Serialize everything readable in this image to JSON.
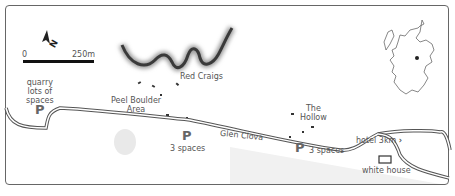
{
  "scale_bar": {
    "start": "0",
    "end": "250m"
  },
  "north_arrow": {
    "label": "N"
  },
  "features": {
    "red_craigs": "Red Craigs",
    "peel_boulder_line1": "Peel Boulder",
    "peel_boulder_line2": "Area",
    "the_hollow_line1": "The",
    "the_hollow_line2": "Hollow",
    "road": "Glen Clova",
    "hotel": "hotel 3km",
    "white_house": "white house"
  },
  "parking": [
    {
      "symbol": "P",
      "line1": "quarry",
      "line2": "lots of",
      "line3": "spaces"
    },
    {
      "symbol": "P",
      "caption": "3 spaces"
    },
    {
      "symbol": "P",
      "caption": "3 spaces"
    }
  ],
  "inset": {
    "region": "Scotland",
    "marker": "location-dot"
  },
  "colors": {
    "road": "#555555",
    "cliff": "#444444",
    "shade": "#eeeeee",
    "frame": "#666666"
  }
}
